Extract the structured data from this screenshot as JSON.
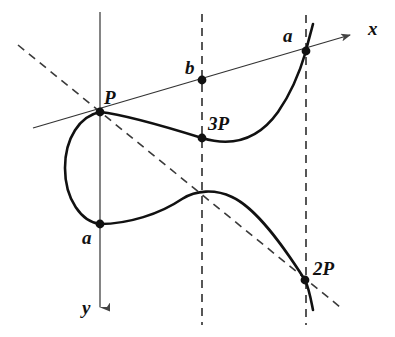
{
  "figure": {
    "background_color": "#ffffff",
    "curve_color": "#111111",
    "axis_color": "#555555",
    "dashed_color": "#333333",
    "secant_color": "#222222",
    "width": 395,
    "height": 337
  },
  "axes": {
    "x_label": "x",
    "y_label": "y",
    "x_axis": {
      "from": [
        33,
        128
      ],
      "to": [
        358,
        33
      ],
      "arrow": true
    },
    "y_axis": {
      "from": [
        100,
        12
      ],
      "to": [
        100,
        314
      ],
      "arrow": true
    }
  },
  "points": [
    {
      "name": "P",
      "label": "P",
      "x": 100,
      "y": 112,
      "label_x": 104,
      "label_y": 88
    },
    {
      "name": "a-left",
      "label": "a",
      "x": 100,
      "y": 224,
      "label_x": 82,
      "label_y": 228
    },
    {
      "name": "b",
      "label": "b",
      "x": 202,
      "y": 80,
      "label_x": 185,
      "label_y": 58
    },
    {
      "name": "3P",
      "label": "3P",
      "x": 202,
      "y": 138,
      "label_x": 208,
      "label_y": 114
    },
    {
      "name": "a-right",
      "label": "a",
      "x": 306,
      "y": 51,
      "label_x": 283,
      "label_y": 26
    },
    {
      "name": "2P",
      "label": "2P",
      "x": 305,
      "y": 280,
      "label_x": 313,
      "label_y": 259
    }
  ],
  "vertical_dashed_lines": [
    {
      "name": "dashed-vertical-b",
      "x": 202,
      "y1": 14,
      "y2": 325
    },
    {
      "name": "dashed-vertical-a",
      "x": 306,
      "y1": 15,
      "y2": 325
    }
  ],
  "diagonal_dashed_line": {
    "name": "dashed-diagonal",
    "from": [
      18,
      45
    ],
    "to": [
      340,
      307
    ],
    "description": "vertical-chord / doubling construction line through P and 2P"
  },
  "secant_line": {
    "name": "secant-line",
    "from": [
      33,
      128
    ],
    "to": [
      358,
      33
    ],
    "description": "line through P, b and a meeting the curve"
  },
  "curve": {
    "name": "elliptic-curve",
    "oval_branch": "closed oval from P(100,112) bulging left to x=65 and down to a(100,224)",
    "upper_branch": "from P(100,112) dipping to minimum near (225,143) then rising steeply through a(306,51) to (313,24)",
    "lower_branch": "from a(100,224) rising to peak near (208,194) then falling through 2P(305,280) down to (313,310)"
  },
  "dot_radius": 4
}
